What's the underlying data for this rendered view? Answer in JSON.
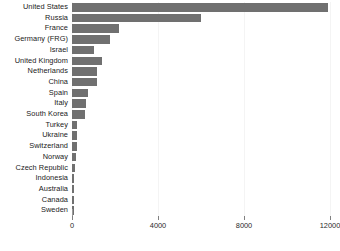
{
  "chart_data": {
    "type": "bar",
    "orientation": "horizontal",
    "title": "",
    "subtitle": "",
    "xlabel": "",
    "ylabel": "",
    "xlim": [
      0,
      12000
    ],
    "ylim": null,
    "grid": true,
    "legend": null,
    "legend_position": "none",
    "xticks": [
      0,
      4000,
      8000,
      12000
    ],
    "xtick_labels": [
      "0",
      "4000",
      "8000",
      "12000"
    ],
    "bar_color": "#707070",
    "background_color": "#ffffff",
    "label_color": "#1a1a1a",
    "gridline_color": "#f4f4f4",
    "categories": [
      "United States",
      "Russia",
      "France",
      "Germany (FRG)",
      "Israel",
      "United Kingdom",
      "Netherlands",
      "China",
      "Spain",
      "Italy",
      "South Korea",
      "Turkey",
      "Ukraine",
      "Switzerland",
      "Norway",
      "Czech Republic",
      "Indonesia",
      "Australia",
      "Canada",
      "Sweden"
    ],
    "values": [
      11900,
      6000,
      2200,
      1750,
      1000,
      1380,
      1180,
      1150,
      760,
      640,
      620,
      240,
      230,
      210,
      180,
      130,
      110,
      100,
      90,
      80
    ]
  }
}
